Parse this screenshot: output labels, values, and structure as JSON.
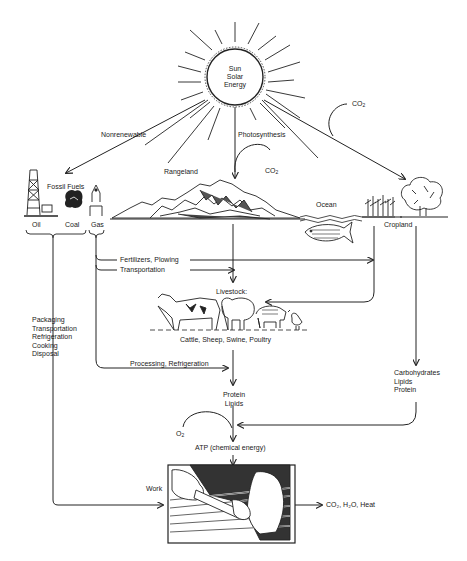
{
  "diagram": {
    "type": "energy-flow",
    "sun": {
      "line1": "Sun",
      "line2": "Solar",
      "line3": "Energy"
    },
    "sources": {
      "nonrenewable_label": "Nonrenewable",
      "photosynthesis_label": "Photosynthesis",
      "fossil_fuels_label": "Fossil Fuels",
      "oil_label": "Oil",
      "coal_label": "Coal",
      "gas_label": "Gas",
      "rangeland_label": "Rangeland",
      "ocean_label": "Ocean",
      "cropland_label": "Cropland",
      "co2_rangeland": "CO",
      "co2_rangeland_sub": "2",
      "co2_top": "CO",
      "co2_top_sub": "2"
    },
    "flows": {
      "fertilizers_label": "Fertilizers, Plowing",
      "transportation_label": "Transportation",
      "processing_label": "Processing, Refrigeration",
      "consumer_uses": "Packaging\nTransportation\nRefrigeration\nCooking\nDisposal",
      "crop_nutrients": "Carbohydrates\nLipids\nProtein"
    },
    "livestock": {
      "title": "Livestock:",
      "caption": "Cattle, Sheep, Swine, Poultry"
    },
    "metabolism": {
      "animal_nutrients": "Protein\nLipids",
      "o2": "O",
      "o2_sub": "2",
      "atp_label": "ATP (chemical energy)",
      "work_label": "Work",
      "outputs_label": "CO₂, H₂O, Heat"
    }
  }
}
